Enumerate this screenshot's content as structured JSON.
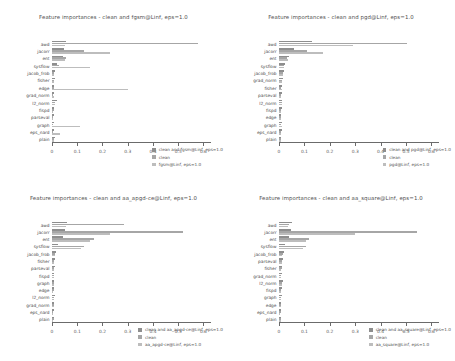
{
  "figure": {
    "n_panels": 4,
    "layout": "2x2",
    "background": "#ffffff"
  },
  "palette": {
    "series0": "#8e8e8e",
    "series1": "#a6a6a6",
    "series2": "#bdbdbd",
    "axis": "#6b6b6b",
    "text": "#4a4a4a"
  },
  "chart_data": [
    {
      "type": "bar",
      "orientation": "horizontal",
      "title": "Feature importances - clean and fgsm@Linf, eps=1.0",
      "xlabel": "",
      "ylabel": "",
      "xlim": [
        0,
        0.63
      ],
      "xticks": [
        0,
        0.1,
        0.2,
        0.3,
        0.4,
        0.5,
        0.6
      ],
      "xticklabels": [
        "0",
        "0.1",
        "0.2",
        "0.3",
        "0.4",
        "0.5",
        "0.6"
      ],
      "grid": false,
      "legend_position": "lower right",
      "categories": [
        "awd",
        "jacorr",
        "ent",
        "sysflow",
        "jacob_frob",
        "fisher",
        "edge",
        "grad_norm",
        "l2_norm",
        "fispd",
        "parseval",
        "graph",
        "eps_nard",
        "plain"
      ],
      "series": [
        {
          "name": "clean and fgsm@Linf, eps=1.0",
          "color": "#8e8e8e",
          "values": [
            0.055,
            0.048,
            0.042,
            0.02,
            0.013,
            0.011,
            0.009,
            0.008,
            0.018,
            0.009,
            0.008,
            0.007,
            0.006,
            0.01
          ]
        },
        {
          "name": "clean",
          "color": "#a6a6a6",
          "values": [
            0.58,
            0.125,
            0.055,
            0.027,
            0.009,
            0.007,
            0.006,
            0.005,
            0.013,
            0.006,
            0.005,
            0.004,
            0.004,
            0.007
          ]
        },
        {
          "name": "fgsm@Linf, eps=1.0",
          "color": "#bdbdbd",
          "values": [
            0.052,
            0.23,
            0.05,
            0.15,
            0.008,
            0.006,
            0.3,
            0.006,
            0.011,
            0.005,
            0.004,
            0.11,
            0.03,
            0.006
          ]
        }
      ]
    },
    {
      "type": "bar",
      "orientation": "horizontal",
      "title": "Feature importances - clean and pgd@Linf, eps=1.0",
      "xlabel": "",
      "ylabel": "",
      "xlim": [
        0,
        0.63
      ],
      "xticks": [
        0,
        0.1,
        0.2,
        0.3,
        0.4,
        0.5,
        0.6
      ],
      "xticklabels": [
        "0",
        "0.1",
        "0.2",
        "0.3",
        "0.4",
        "0.5",
        "0.6"
      ],
      "grid": false,
      "legend_position": "lower right",
      "categories": [
        "awd",
        "jacorr",
        "ent",
        "sysflow",
        "jacob_frob",
        "grad_norm",
        "fisher",
        "parseval",
        "l2_norm",
        "fispd",
        "edge",
        "graph",
        "eps_nard",
        "plain"
      ],
      "series": [
        {
          "name": "clean and pgd@Linf, eps=1.0",
          "color": "#8e8e8e",
          "values": [
            0.13,
            0.06,
            0.04,
            0.025,
            0.02,
            0.015,
            0.012,
            0.011,
            0.013,
            0.01,
            0.009,
            0.012,
            0.01,
            0.009
          ]
        },
        {
          "name": "clean",
          "color": "#a6a6a6",
          "values": [
            0.505,
            0.11,
            0.03,
            0.018,
            0.014,
            0.011,
            0.009,
            0.008,
            0.01,
            0.007,
            0.006,
            0.009,
            0.007,
            0.006
          ]
        },
        {
          "name": "pgd@Linf, eps=1.0",
          "color": "#bdbdbd",
          "values": [
            0.29,
            0.175,
            0.035,
            0.02,
            0.016,
            0.012,
            0.01,
            0.009,
            0.011,
            0.008,
            0.007,
            0.01,
            0.008,
            0.007
          ]
        }
      ]
    },
    {
      "type": "bar",
      "orientation": "horizontal",
      "title": "Feature importances - clean and aa_apgd-ce@Linf, eps=1.0",
      "xlabel": "",
      "ylabel": "",
      "xlim": [
        0,
        0.63
      ],
      "xticks": [
        0,
        0.1,
        0.2,
        0.3,
        0.4,
        0.5,
        0.6
      ],
      "xticklabels": [
        "0",
        "0.1",
        "0.2",
        "0.3",
        "0.4",
        "0.5",
        "0.6"
      ],
      "grid": false,
      "legend_position": "lower right",
      "categories": [
        "awd",
        "jacorr",
        "ent",
        "sysflow",
        "jacob_frob",
        "fisher",
        "parseval",
        "fispd",
        "graph",
        "edge",
        "l2_norm",
        "grad_norm",
        "eps_nard",
        "plain"
      ],
      "series": [
        {
          "name": "clean and aa_apgd-ce@Linf, eps=1.0",
          "color": "#8e8e8e",
          "values": [
            0.06,
            0.05,
            0.042,
            0.022,
            0.016,
            0.012,
            0.01,
            0.009,
            0.009,
            0.008,
            0.012,
            0.009,
            0.007,
            0.008
          ]
        },
        {
          "name": "clean",
          "color": "#a6a6a6",
          "values": [
            0.285,
            0.52,
            0.165,
            0.125,
            0.012,
            0.009,
            0.008,
            0.007,
            0.007,
            0.006,
            0.009,
            0.007,
            0.005,
            0.006
          ]
        },
        {
          "name": "aa_apgd-ce@Linf, eps=1.0",
          "color": "#bdbdbd",
          "values": [
            0.055,
            0.23,
            0.15,
            0.115,
            0.01,
            0.008,
            0.007,
            0.006,
            0.006,
            0.005,
            0.008,
            0.006,
            0.004,
            0.005
          ]
        }
      ]
    },
    {
      "type": "bar",
      "orientation": "horizontal",
      "title": "Feature importances - clean and aa_square@Linf, eps=1.0",
      "xlabel": "",
      "ylabel": "",
      "xlim": [
        0,
        0.63
      ],
      "xticks": [
        0,
        0.1,
        0.2,
        0.3,
        0.4,
        0.5,
        0.6
      ],
      "xticklabels": [
        "0",
        "0.1",
        "0.2",
        "0.3",
        "0.4",
        "0.5",
        "0.6"
      ],
      "grid": false,
      "legend_position": "lower right",
      "categories": [
        "awd",
        "jacorr",
        "ent",
        "sysflow",
        "jacob_frob",
        "parseval",
        "fisher",
        "grad_norm",
        "l2_norm",
        "fispd",
        "graph",
        "edge",
        "eps_nard",
        "plain"
      ],
      "series": [
        {
          "name": "clean and aa_square@Linf, eps=1.0",
          "color": "#8e8e8e",
          "values": [
            0.05,
            0.046,
            0.04,
            0.024,
            0.018,
            0.014,
            0.012,
            0.011,
            0.014,
            0.01,
            0.01,
            0.009,
            0.008,
            0.009
          ]
        },
        {
          "name": "clean",
          "color": "#a6a6a6",
          "values": [
            0.04,
            0.545,
            0.12,
            0.105,
            0.015,
            0.011,
            0.01,
            0.009,
            0.011,
            0.008,
            0.008,
            0.007,
            0.006,
            0.007
          ]
        },
        {
          "name": "aa_square@Linf, eps=1.0",
          "color": "#bdbdbd",
          "values": [
            0.035,
            0.3,
            0.108,
            0.095,
            0.013,
            0.01,
            0.009,
            0.008,
            0.01,
            0.007,
            0.007,
            0.006,
            0.005,
            0.006
          ]
        }
      ]
    }
  ]
}
